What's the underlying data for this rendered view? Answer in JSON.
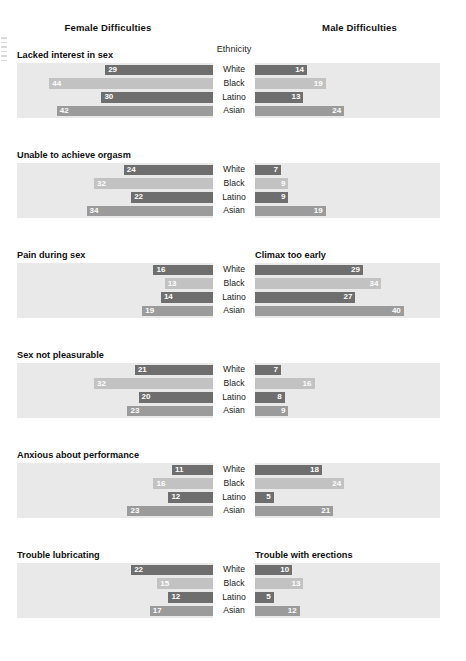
{
  "headers": {
    "female": "Female Difficulties",
    "male": "Male Difficulties",
    "ethnicity": "Ethnicity"
  },
  "chart_data": {
    "type": "bar",
    "orientation": "horizontal",
    "categories": [
      "White",
      "Black",
      "Latino",
      "Asian"
    ],
    "xlabel": "",
    "ylabel": "Ethnicity",
    "xlim": [
      0,
      50
    ],
    "grid": false,
    "legend": "none",
    "value_unit": "percent",
    "series_colors": {
      "White": "#6e6e6e",
      "Black": "#c2c2c2",
      "Latino": "#6e6e6e",
      "Asian": "#9b9b9b"
    },
    "panel_background": "#e9e9e9",
    "groups": [
      {
        "left_title": "Lacked interest in sex",
        "right_title": "",
        "left_values": [
          29,
          44,
          30,
          42
        ],
        "right_values": [
          14,
          19,
          13,
          24
        ]
      },
      {
        "left_title": "Unable to achieve orgasm",
        "right_title": "",
        "left_values": [
          24,
          32,
          22,
          34
        ],
        "right_values": [
          7,
          9,
          9,
          19
        ]
      },
      {
        "left_title": "Pain during sex",
        "right_title": "Climax too early",
        "left_values": [
          16,
          13,
          14,
          19
        ],
        "right_values": [
          29,
          34,
          27,
          40
        ]
      },
      {
        "left_title": "Sex not pleasurable",
        "right_title": "",
        "left_values": [
          21,
          32,
          20,
          23
        ],
        "right_values": [
          7,
          16,
          8,
          9
        ]
      },
      {
        "left_title": "Anxious about performance",
        "right_title": "",
        "left_values": [
          11,
          16,
          12,
          23
        ],
        "right_values": [
          18,
          24,
          5,
          21
        ]
      },
      {
        "left_title": "Trouble lubricating",
        "right_title": "Trouble with erections",
        "left_values": [
          22,
          15,
          12,
          17
        ],
        "right_values": [
          10,
          13,
          5,
          12
        ]
      }
    ]
  }
}
